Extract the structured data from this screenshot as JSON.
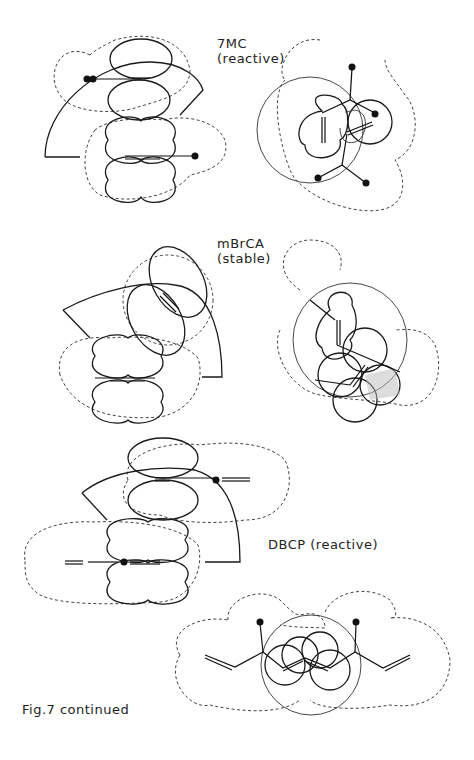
{
  "figure": {
    "caption": "Fig.7 continued",
    "panels": [
      {
        "id": "7mc",
        "name": "7MC",
        "status": "(reactive)"
      },
      {
        "id": "mbrca",
        "name": "mBrCA",
        "status": "(stable)"
      },
      {
        "id": "dbcp",
        "label": "DBCP (reactive)"
      }
    ]
  },
  "colors": {
    "line": "#1a1a1a",
    "background": "#ffffff"
  }
}
